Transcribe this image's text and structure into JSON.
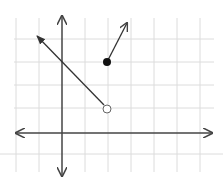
{
  "graph": {
    "title": "Piecewise function graph",
    "origin_px": [
      62,
      133
    ],
    "unit_px": 23,
    "grid": {
      "x_lines_px": [
        16,
        39,
        62,
        85,
        108,
        131,
        154,
        177,
        200
      ],
      "y_lines_px": [
        39,
        62,
        85,
        108,
        154
      ],
      "color": "#d9d9d9"
    },
    "axes": {
      "color": "#444444",
      "x_axis": {
        "from": [
          14,
          133
        ],
        "to": [
          212,
          133
        ]
      },
      "y_axis": {
        "from": [
          62,
          16
        ],
        "to": [
          62,
          176
        ]
      }
    },
    "pieces": [
      {
        "name": "decreasing-ray",
        "slope": -1,
        "from_point": [
          2,
          1
        ],
        "endpoint_type": "open",
        "direction": "left-up",
        "arrow_end_px": [
          36,
          35
        ]
      },
      {
        "name": "increasing-ray",
        "slope": 2,
        "from_point": [
          2,
          3
        ],
        "endpoint_type": "closed",
        "direction": "right-up",
        "arrow_end_px": [
          128,
          22
        ]
      }
    ]
  }
}
